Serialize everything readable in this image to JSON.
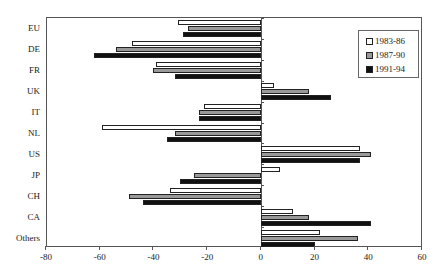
{
  "chart_data": {
    "type": "bar",
    "orientation": "horizontal",
    "title": "",
    "xlabel": "",
    "ylabel": "",
    "xlim": [
      -80,
      60
    ],
    "xticks": [
      -80,
      -60,
      -40,
      -20,
      0,
      20,
      40,
      60
    ],
    "grid": false,
    "legend_position": "upper right, inside",
    "categories": [
      "EU",
      "DE",
      "FR",
      "UK",
      "IT",
      "NL",
      "US",
      "JP",
      "CH",
      "CA",
      "Others"
    ],
    "series": [
      {
        "name": "1983-86",
        "color": "#ffffff",
        "values": [
          -31,
          -48,
          -39,
          5,
          -21,
          -59,
          37,
          7,
          -34,
          12,
          22
        ]
      },
      {
        "name": "1987-90",
        "color": "#999999",
        "values": [
          -27,
          -54,
          -40,
          18,
          -23,
          -32,
          41,
          -25,
          -49,
          18,
          36
        ]
      },
      {
        "name": "1991-94",
        "color": "#111111",
        "values": [
          -29,
          -62,
          -32,
          26,
          -23,
          -35,
          37,
          -30,
          -44,
          41,
          20
        ]
      }
    ]
  }
}
